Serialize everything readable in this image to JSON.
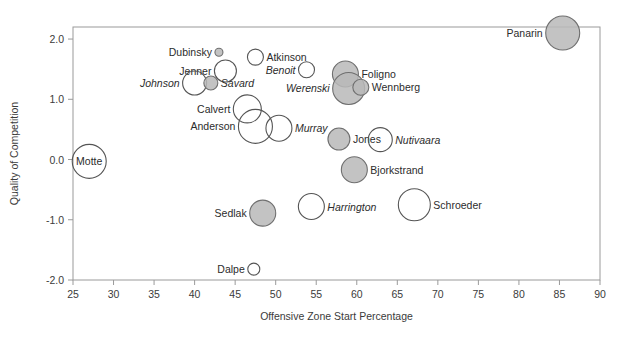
{
  "chart_data": {
    "type": "scatter",
    "title": "",
    "xlabel": "Offensive Zone Start Percentage",
    "ylabel": "Quality of Competition",
    "xlim": [
      25,
      90
    ],
    "ylim": [
      -2.0,
      2.2
    ],
    "xticks": [
      25,
      30,
      35,
      40,
      45,
      50,
      55,
      60,
      65,
      70,
      75,
      80,
      85,
      90
    ],
    "xticklabels": [
      "25",
      "30",
      "35",
      "40",
      "45",
      "50",
      "55",
      "60",
      "65",
      "70",
      "75",
      "80",
      "85",
      "90"
    ],
    "yticks": [
      2.0,
      1.0,
      0.0,
      -1.0,
      -2.0
    ],
    "yticklabels": [
      "2.0",
      "1.0",
      "0.0",
      "-1.0",
      "-2.0"
    ],
    "grid": false,
    "legend": "none",
    "size_encoding": "bubble area = time on ice",
    "fill_note": "filled grey = one group, open = other group",
    "points": [
      {
        "name": "Panarin",
        "x": 85.4,
        "y": 2.1,
        "r": 17,
        "fill": "filled",
        "label_side": "left",
        "label_italic": false
      },
      {
        "name": "Dubinsky",
        "x": 43.0,
        "y": 1.78,
        "r": 4,
        "fill": "filled",
        "label_side": "left",
        "label_italic": false
      },
      {
        "name": "Atkinson",
        "x": 47.5,
        "y": 1.7,
        "r": 8,
        "fill": "open",
        "label_side": "right",
        "label_italic": false
      },
      {
        "name": "Jenner",
        "x": 43.8,
        "y": 1.47,
        "r": 11,
        "fill": "open",
        "label_side": "left",
        "label_italic": false
      },
      {
        "name": "Benoit",
        "x": 53.8,
        "y": 1.49,
        "r": 8,
        "fill": "open",
        "label_side": "left",
        "label_italic": true
      },
      {
        "name": "Foligno",
        "x": 58.6,
        "y": 1.42,
        "r": 13,
        "fill": "filled",
        "label_side": "right",
        "label_italic": false
      },
      {
        "name": "Johnson",
        "x": 40.0,
        "y": 1.27,
        "r": 12,
        "fill": "open",
        "label_side": "left",
        "label_italic": true
      },
      {
        "name": "Savard",
        "x": 42.0,
        "y": 1.27,
        "r": 7,
        "fill": "filled",
        "label_side": "right",
        "label_italic": true
      },
      {
        "name": "Werenski",
        "x": 59.0,
        "y": 1.18,
        "r": 16,
        "fill": "filled",
        "label_side": "left",
        "label_italic": true
      },
      {
        "name": "Wennberg",
        "x": 60.5,
        "y": 1.2,
        "r": 8,
        "fill": "filled",
        "label_side": "right",
        "label_italic": false
      },
      {
        "name": "Calvert",
        "x": 46.5,
        "y": 0.84,
        "r": 14,
        "fill": "open",
        "label_side": "left",
        "label_italic": false
      },
      {
        "name": "Anderson",
        "x": 47.5,
        "y": 0.55,
        "r": 17,
        "fill": "open",
        "label_side": "left",
        "label_italic": false
      },
      {
        "name": "Murray",
        "x": 50.4,
        "y": 0.52,
        "r": 13,
        "fill": "open",
        "label_side": "right",
        "label_italic": true
      },
      {
        "name": "Jones",
        "x": 57.8,
        "y": 0.34,
        "r": 11,
        "fill": "filled",
        "label_side": "right",
        "label_italic": false
      },
      {
        "name": "Nutivaara",
        "x": 62.9,
        "y": 0.33,
        "r": 12,
        "fill": "open",
        "label_side": "right",
        "label_italic": true
      },
      {
        "name": "Motte",
        "x": 27.0,
        "y": -0.03,
        "r": 17,
        "fill": "open",
        "label_side": "center",
        "label_italic": false
      },
      {
        "name": "Bjorkstrand",
        "x": 59.7,
        "y": -0.17,
        "r": 13,
        "fill": "filled",
        "label_side": "right",
        "label_italic": false
      },
      {
        "name": "Harrington",
        "x": 54.4,
        "y": -0.78,
        "r": 13,
        "fill": "open",
        "label_side": "right",
        "label_italic": true
      },
      {
        "name": "Schroeder",
        "x": 67.1,
        "y": -0.75,
        "r": 16,
        "fill": "open",
        "label_side": "right",
        "label_italic": false
      },
      {
        "name": "Sedlak",
        "x": 48.4,
        "y": -0.89,
        "r": 13,
        "fill": "filled",
        "label_side": "left",
        "label_italic": false
      },
      {
        "name": "Dalpe",
        "x": 47.3,
        "y": -1.82,
        "r": 6,
        "fill": "open",
        "label_side": "left",
        "label_italic": false
      }
    ]
  },
  "colors": {
    "fill_grey": "#b9b9b9",
    "stroke_grey": "#6f6f6f",
    "open_stroke": "#555555",
    "axis": "#9a9a9a",
    "text": "#2c2c2c",
    "background": "#ffffff"
  }
}
